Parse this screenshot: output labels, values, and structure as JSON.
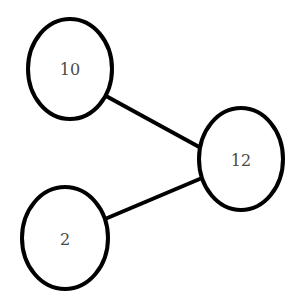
{
  "diagram": {
    "type": "tree",
    "background": "#ffffff",
    "stroke_color": "#000000",
    "text_color": "#4a4a4a",
    "nodes": [
      {
        "id": "n10",
        "label": "10",
        "cx": 70,
        "cy": 69,
        "rx": 42,
        "ry": 50
      },
      {
        "id": "n12",
        "label": "12",
        "cx": 241,
        "cy": 159,
        "rx": 42,
        "ry": 51
      },
      {
        "id": "n2",
        "label": "2",
        "cx": 65,
        "cy": 238,
        "rx": 43,
        "ry": 51
      }
    ],
    "edges": [
      {
        "from": "12",
        "to": "10",
        "x1": 106,
        "y1": 96,
        "x2": 201,
        "y2": 148
      },
      {
        "from": "12",
        "to": "2",
        "x1": 105,
        "y1": 219,
        "x2": 202,
        "y2": 178
      }
    ]
  }
}
